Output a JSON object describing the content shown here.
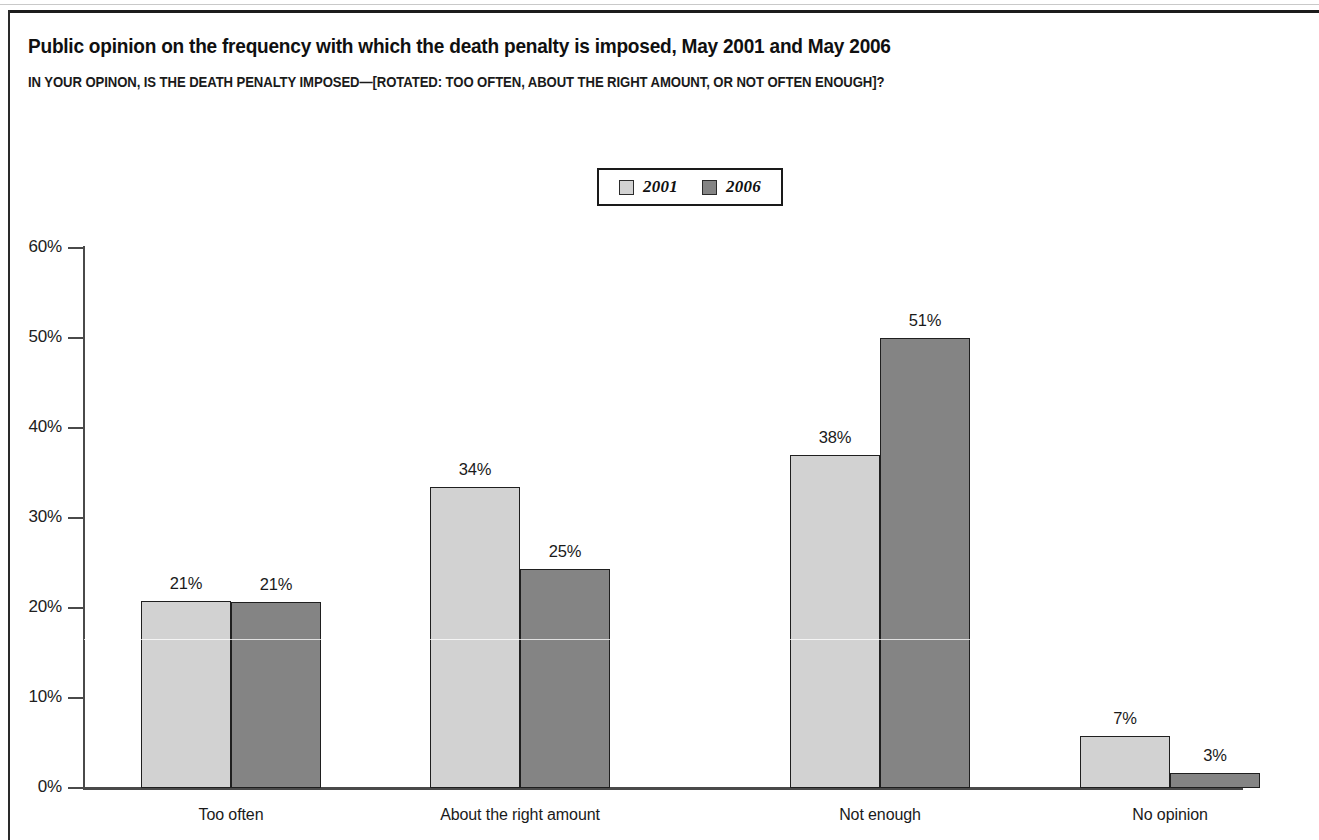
{
  "header": {
    "title": "Public opinion on the frequency with which the death penalty is imposed, May 2001 and May 2006",
    "subtitle": "IN YOUR OPINON, IS THE DEATH PENALTY IMPOSED—[ROTATED: TOO OFTEN, ABOUT THE RIGHT AMOUNT, OR NOT OFTEN ENOUGH]?"
  },
  "legend": {
    "items": [
      {
        "label": "2001",
        "color": "#d2d2d2"
      },
      {
        "label": "2006",
        "color": "#848484"
      }
    ]
  },
  "chart_data": {
    "type": "bar",
    "title": "Public opinion on the frequency with which the death penalty is imposed, May 2001 and May 2006",
    "subtitle": "IN YOUR OPINON, IS THE DEATH PENALTY IMPOSED—[ROTATED: TOO OFTEN, ABOUT THE RIGHT AMOUNT, OR NOT OFTEN ENOUGH]?",
    "categories": [
      "Too often",
      "About the right amount",
      "Not enough",
      "No opinion"
    ],
    "series": [
      {
        "name": "2001",
        "color": "#d2d2d2",
        "values": [
          21,
          34,
          38,
          7
        ],
        "labels": [
          "21%",
          "34%",
          "38%",
          "7%"
        ]
      },
      {
        "name": "2006",
        "color": "#848484",
        "values": [
          21,
          25,
          51,
          3
        ],
        "labels": [
          "21%",
          "25%",
          "51%",
          "3%"
        ]
      }
    ],
    "xlabel": "",
    "ylabel": "",
    "ylim": [
      0,
      60
    ],
    "yticks": [
      0,
      10,
      20,
      30,
      40,
      50,
      60
    ],
    "ytick_labels": [
      "0%",
      "10%",
      "20%",
      "30%",
      "40%",
      "50%",
      "60%"
    ],
    "grid": false,
    "legend_position": "top-center",
    "value_labels": true
  }
}
